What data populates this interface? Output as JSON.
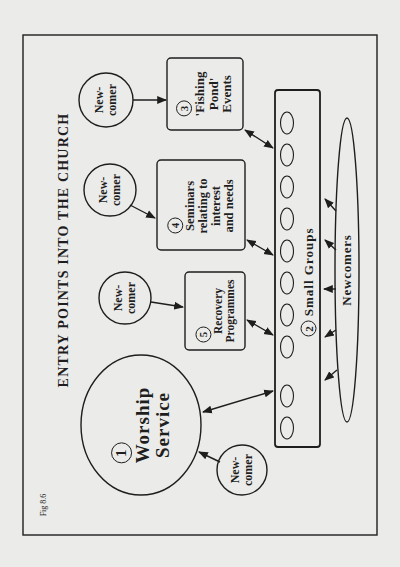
{
  "figure": {
    "label": "Fig 8.6",
    "title": "ENTRY POINTS INTO THE CHURCH",
    "orientation": "rotated 90 degrees counter-clockwise",
    "colors": {
      "ink": "#1e1e1e",
      "paper": "#ebebe9"
    }
  },
  "nodes": {
    "worship": {
      "number": "1",
      "line1": "Worship",
      "line2": "Service"
    },
    "small_groups": {
      "number": "2",
      "label": "Small Groups",
      "circle_count": 10
    },
    "fishing_pond": {
      "number": "3",
      "line1": "'Fishing",
      "line2": "Pond'",
      "line3": "Events"
    },
    "seminars": {
      "number": "4",
      "line1": "Seminars",
      "line2": "relating to",
      "line3": "interest",
      "line4": "and needs"
    },
    "recovery": {
      "number": "5",
      "line1": "Recovery",
      "line2": "Programmes"
    },
    "newcomers_pool": {
      "label": "Newcomers"
    }
  },
  "newcomer_bubbles": [
    {
      "line1": "New-",
      "line2": "comer",
      "target": "fishing_pond"
    },
    {
      "line1": "New-",
      "line2": "comer",
      "target": "seminars"
    },
    {
      "line1": "New-",
      "line2": "comer",
      "target": "recovery"
    },
    {
      "line1": "New-",
      "line2": "comer",
      "target": "worship"
    }
  ],
  "edges": [
    {
      "from": "newcomer_1",
      "to": "fishing_pond",
      "type": "one-way"
    },
    {
      "from": "newcomer_2",
      "to": "seminars",
      "type": "one-way"
    },
    {
      "from": "newcomer_3",
      "to": "recovery",
      "type": "one-way"
    },
    {
      "from": "newcomer_4",
      "to": "worship",
      "type": "one-way"
    },
    {
      "from": "fishing_pond",
      "to": "small_groups",
      "type": "two-way"
    },
    {
      "from": "seminars",
      "to": "small_groups",
      "type": "two-way"
    },
    {
      "from": "recovery",
      "to": "small_groups",
      "type": "two-way"
    },
    {
      "from": "worship",
      "to": "small_groups",
      "type": "two-way"
    },
    {
      "from": "newcomers_pool",
      "to": "small_groups",
      "type": "one-way",
      "count": 5
    }
  ]
}
